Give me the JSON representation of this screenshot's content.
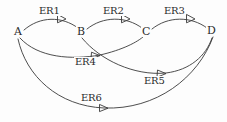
{
  "diagram": {
    "type": "directed-graph",
    "canvas": {
      "width": 227,
      "height": 122,
      "background": "#fdfdfd"
    },
    "stroke_color": "#3a3a3a",
    "text_color": "#2b2b2b",
    "nodes": [
      {
        "id": "A",
        "label": "A",
        "x": 17,
        "y": 32
      },
      {
        "id": "B",
        "label": "B",
        "x": 80,
        "y": 32
      },
      {
        "id": "C",
        "label": "C",
        "x": 145,
        "y": 32
      },
      {
        "id": "D",
        "label": "D",
        "x": 210,
        "y": 31
      }
    ],
    "edges": [
      {
        "id": "ER1",
        "label": "ER1",
        "from": "A",
        "to": "B",
        "label_x": 38,
        "label_y": 6,
        "path": "M 24 30 C 40 16, 62 16, 78 28",
        "arrow": {
          "x": 62,
          "y": 19,
          "angle": 28
        }
      },
      {
        "id": "ER2",
        "label": "ER2",
        "from": "B",
        "to": "C",
        "label_x": 102,
        "label_y": 6,
        "path": "M 87 29 C 103 16, 126 16, 142 28",
        "arrow": {
          "x": 126,
          "y": 19,
          "angle": 28
        }
      },
      {
        "id": "ER3",
        "label": "ER3",
        "from": "C",
        "to": "D",
        "label_x": 163,
        "label_y": 6,
        "path": "M 152 29 C 168 16, 191 16, 207 28",
        "arrow": {
          "x": 191,
          "y": 19,
          "angle": 28
        }
      },
      {
        "id": "ER4",
        "label": "ER4",
        "from": "A",
        "to": "C",
        "label_x": 74,
        "label_y": 57,
        "path": "M 20 38 C 38 58, 72 60, 100 55 C 122 50, 138 42, 144 36",
        "arrow": {
          "x": 97,
          "y": 56,
          "angle": -9
        }
      },
      {
        "id": "ER5",
        "label": "ER5",
        "from": "B",
        "to": "D",
        "label_x": 143,
        "label_y": 76,
        "path": "M 82 38 C 100 60, 134 76, 166 73 C 190 70, 206 56, 212 38",
        "arrow": {
          "x": 163,
          "y": 74,
          "angle": -14
        }
      },
      {
        "id": "ER6",
        "label": "ER6",
        "from": "A",
        "to": "D",
        "label_x": 80,
        "label_y": 93,
        "path": "M 18 39 C 26 76, 58 106, 104 108 C 156 110, 198 78, 213 37",
        "arrow": {
          "x": 106,
          "y": 108,
          "angle": 3
        }
      }
    ]
  }
}
